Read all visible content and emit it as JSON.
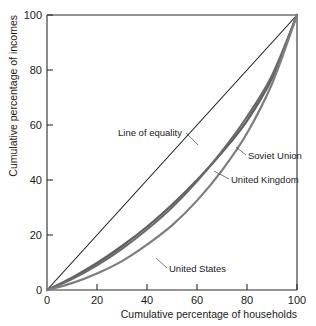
{
  "chart_data": {
    "type": "line",
    "title": "",
    "xlabel": "Cumulative percentage of households",
    "ylabel": "Cumulative percentage of incomes",
    "xlim": [
      0,
      100
    ],
    "ylim": [
      0,
      100
    ],
    "xticks": [
      0,
      20,
      40,
      60,
      80,
      100
    ],
    "yticks": [
      0,
      20,
      40,
      60,
      80,
      100
    ],
    "xtick_labels": [
      "0",
      "20",
      "40",
      "60",
      "80",
      "100"
    ],
    "ytick_labels": [
      "0",
      "20",
      "40",
      "60",
      "80",
      "100"
    ],
    "grid": false,
    "legend_position": "inline-annotations",
    "x": [
      0,
      10,
      20,
      30,
      40,
      50,
      60,
      70,
      80,
      90,
      100
    ],
    "series": [
      {
        "name": "Line of equality",
        "color": "#1a1a1a",
        "width": 1.1,
        "values": [
          0,
          10,
          20,
          30,
          40,
          50,
          60,
          70,
          80,
          90,
          100
        ]
      },
      {
        "name": "Soviet Union",
        "color": "#5e5e5e",
        "width": 2.2,
        "values": [
          0,
          4.5,
          9.8,
          16.0,
          23.0,
          31.0,
          40.0,
          50.0,
          61.5,
          77.0,
          100
        ]
      },
      {
        "name": "United Kingdom",
        "color": "#6a6a6a",
        "width": 2.2,
        "values": [
          0,
          4.0,
          9.0,
          15.0,
          22.0,
          30.0,
          39.5,
          50.5,
          63.0,
          78.0,
          100
        ]
      },
      {
        "name": "United States",
        "color": "#7d7d7d",
        "width": 2.2,
        "values": [
          0,
          2.5,
          6.0,
          10.5,
          16.5,
          23.5,
          32.5,
          43.5,
          57.0,
          75.0,
          100
        ]
      }
    ],
    "annotations": [
      {
        "text": "Line of equality",
        "x": 38,
        "y": 57
      },
      {
        "text": "Soviet Union",
        "x": 78,
        "y": 45
      },
      {
        "text": "United Kingdom",
        "x": 72,
        "y": 35
      },
      {
        "text": "United States",
        "x": 40,
        "y": 11
      }
    ]
  }
}
